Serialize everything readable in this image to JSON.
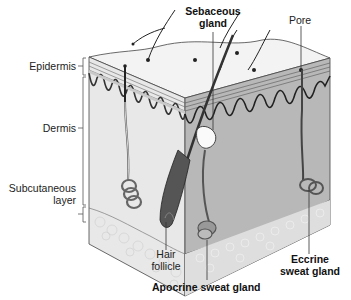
{
  "diagram": {
    "labels": {
      "epidermis": "Epidermis",
      "dermis": "Dermis",
      "subcutaneous_1": "Subcutaneous",
      "subcutaneous_2": "layer",
      "sebaceous_1": "Sebaceous",
      "sebaceous_2": "gland",
      "pore": "Pore",
      "hair_1": "Hair",
      "hair_2": "follicle",
      "apocrine": "Apocrine sweat gland",
      "eccrine_1": "Eccrine",
      "eccrine_2": "sweat gland"
    },
    "colors": {
      "top_face": "#f2f2f2",
      "left_face": "#e6e6e6",
      "right_face": "#b5b5b5",
      "epidermis_band": "#c8c8c8",
      "outline": "#333333",
      "fat": "#eeeeee"
    }
  }
}
